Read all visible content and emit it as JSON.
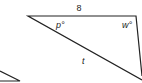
{
  "diagram": {
    "labels": {
      "top_side": "8",
      "angle_left": "p°",
      "angle_right": "w°",
      "hypotenuse": "t"
    },
    "colors": {
      "stroke": "#222222",
      "background": "#ffffff"
    }
  }
}
